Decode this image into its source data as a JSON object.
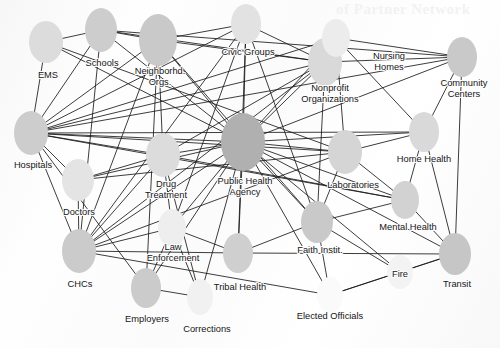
{
  "figure": {
    "type": "network-diagram",
    "domain_label": "public-health-partner-network",
    "background_color": "#fdfdfd",
    "node_fill_default": "#cfcfcf",
    "node_fill_central": "#b0b0b0",
    "edge_color": "#1a1a1a",
    "label_color": "#151515",
    "bleed_through_text": "of Partner Network"
  },
  "nodes": [
    {
      "id": "ems",
      "label": "EMS",
      "lines": [
        "EMS"
      ],
      "cx": 46,
      "cy": 42,
      "rx": 17,
      "ry": 21,
      "fill": "#dcdcdc",
      "label_x": 48,
      "label_y": 76,
      "interactable": true
    },
    {
      "id": "schools",
      "label": "Schools",
      "lines": [
        "Schools"
      ],
      "cx": 101,
      "cy": 30,
      "rx": 16,
      "ry": 22,
      "fill": "#cdcdcd",
      "label_x": 102,
      "label_y": 64,
      "interactable": true
    },
    {
      "id": "neighborhood",
      "label": "Neighborhd. Orgs.",
      "lines": [
        "Neighborhd.",
        "Orgs."
      ],
      "cx": 158,
      "cy": 40,
      "rx": 19,
      "ry": 26,
      "fill": "#c9c9c9",
      "label_x": 160,
      "label_y": 77,
      "interactable": true
    },
    {
      "id": "civic",
      "label": "Civic Groups",
      "lines": [
        "Civic Groups"
      ],
      "cx": 246,
      "cy": 24,
      "rx": 15,
      "ry": 20,
      "fill": "#e2e2e2",
      "label_x": 248,
      "label_y": 53,
      "interactable": true
    },
    {
      "id": "nonprofit",
      "label": "Nonprofit Organizations",
      "lines": [
        "Nonprofit",
        "Organizations"
      ],
      "cx": 325,
      "cy": 62,
      "rx": 17,
      "ry": 24,
      "fill": "#d9d9d9",
      "label_x": 330,
      "label_y": 94,
      "interactable": true
    },
    {
      "id": "nursing",
      "label": "Nursing Homes",
      "lines": [
        "Nursing",
        "Homes"
      ],
      "cx": 336,
      "cy": 38,
      "rx": 14,
      "ry": 19,
      "fill": "#ececec",
      "label_x": 389,
      "label_y": 62,
      "interactable": true
    },
    {
      "id": "community",
      "label": "Community Centers",
      "lines": [
        "Community",
        "Centers"
      ],
      "cx": 462,
      "cy": 57,
      "rx": 15,
      "ry": 20,
      "fill": "#c9c9c9",
      "label_x": 464,
      "label_y": 89,
      "interactable": true
    },
    {
      "id": "hospitals",
      "label": "Hospitals",
      "lines": [
        "Hospitals"
      ],
      "cx": 31,
      "cy": 133,
      "rx": 17,
      "ry": 22,
      "fill": "#cdcdcd",
      "label_x": 33,
      "label_y": 166,
      "interactable": true
    },
    {
      "id": "doctors",
      "label": "Doctors",
      "lines": [
        "Doctors"
      ],
      "cx": 78,
      "cy": 180,
      "rx": 16,
      "ry": 21,
      "fill": "#e4e4e4",
      "label_x": 79,
      "label_y": 213,
      "interactable": true
    },
    {
      "id": "drug",
      "label": "Drug Treatment",
      "lines": [
        "Drug",
        "Treatment"
      ],
      "cx": 163,
      "cy": 155,
      "rx": 17,
      "ry": 22,
      "fill": "#dcdcdc",
      "label_x": 166,
      "label_y": 190,
      "interactable": true
    },
    {
      "id": "publichealth",
      "label": "Public Health Agency",
      "lines": [
        "Public Health",
        "Agency"
      ],
      "cx": 243,
      "cy": 142,
      "rx": 22,
      "ry": 29,
      "fill": "#b0b0b0",
      "label_x": 245,
      "label_y": 187,
      "interactable": true
    },
    {
      "id": "laboratories",
      "label": "Laboratories",
      "lines": [
        "Laboratories"
      ],
      "cx": 345,
      "cy": 152,
      "rx": 17,
      "ry": 22,
      "fill": "#d5d5d5",
      "label_x": 353,
      "label_y": 186,
      "interactable": true
    },
    {
      "id": "homehealth",
      "label": "Home Health",
      "lines": [
        "Home Health"
      ],
      "cx": 424,
      "cy": 132,
      "rx": 15,
      "ry": 20,
      "fill": "#d9d9d9",
      "label_x": 424,
      "label_y": 160,
      "interactable": true
    },
    {
      "id": "mentalhealth",
      "label": "Mental Health",
      "lines": [
        "Mental Health"
      ],
      "cx": 405,
      "cy": 200,
      "rx": 14,
      "ry": 19,
      "fill": "#d2d2d2",
      "label_x": 408,
      "label_y": 228,
      "interactable": true
    },
    {
      "id": "chcs",
      "label": "CHCs",
      "lines": [
        "CHCs"
      ],
      "cx": 79,
      "cy": 251,
      "rx": 17,
      "ry": 22,
      "fill": "#cbcbcb",
      "label_x": 80,
      "label_y": 285,
      "interactable": true
    },
    {
      "id": "law",
      "label": "Law Enforcement",
      "lines": [
        "Law",
        "Enforcement"
      ],
      "cx": 172,
      "cy": 228,
      "rx": 14,
      "ry": 19,
      "fill": "#eeeeee",
      "label_x": 173,
      "label_y": 253,
      "interactable": true
    },
    {
      "id": "faith",
      "label": "Faith Instit.",
      "lines": [
        "Faith Instit."
      ],
      "cx": 317,
      "cy": 222,
      "rx": 16,
      "ry": 21,
      "fill": "#c9c9c9",
      "label_x": 320,
      "label_y": 251,
      "interactable": true
    },
    {
      "id": "transit",
      "label": "Transit",
      "lines": [
        "Transit"
      ],
      "cx": 455,
      "cy": 254,
      "rx": 16,
      "ry": 21,
      "fill": "#c6c6c6",
      "label_x": 457,
      "label_y": 285,
      "interactable": true
    },
    {
      "id": "fire",
      "label": "Fire",
      "lines": [
        "Fire"
      ],
      "cx": 400,
      "cy": 272,
      "rx": 13,
      "ry": 17,
      "fill": "#f3f3f3",
      "label_x": 400,
      "label_y": 275,
      "interactable": true
    },
    {
      "id": "tribal",
      "label": "Tribal Health",
      "lines": [
        "Tribal Health"
      ],
      "cx": 238,
      "cy": 253,
      "rx": 15,
      "ry": 20,
      "fill": "#cfcfcf",
      "label_x": 240,
      "label_y": 288,
      "interactable": true
    },
    {
      "id": "employers",
      "label": "Employers",
      "lines": [
        "Employers"
      ],
      "cx": 146,
      "cy": 288,
      "rx": 15,
      "ry": 20,
      "fill": "#cbcbcb",
      "label_x": 147,
      "label_y": 320,
      "interactable": true
    },
    {
      "id": "corrections",
      "label": "Corrections",
      "lines": [
        "Corrections"
      ],
      "cx": 200,
      "cy": 297,
      "rx": 13,
      "ry": 18,
      "fill": "#f1f1f1",
      "label_x": 207,
      "label_y": 330,
      "interactable": true
    },
    {
      "id": "elected",
      "label": "Elected Officials",
      "lines": [
        "Elected Officials"
      ],
      "cx": 330,
      "cy": 295,
      "rx": 13,
      "ry": 18,
      "fill": "#fafafa",
      "label_x": 330,
      "label_y": 317,
      "interactable": true
    }
  ],
  "edges": [
    {
      "source": "ems",
      "target": "hospitals"
    },
    {
      "source": "ems",
      "target": "publichealth"
    },
    {
      "source": "ems",
      "target": "schools"
    },
    {
      "source": "ems",
      "target": "laboratories"
    },
    {
      "source": "schools",
      "target": "neighborhood"
    },
    {
      "source": "schools",
      "target": "publichealth"
    },
    {
      "source": "schools",
      "target": "hospitals"
    },
    {
      "source": "schools",
      "target": "chcs"
    },
    {
      "source": "schools",
      "target": "community"
    },
    {
      "source": "schools",
      "target": "nonprofit"
    },
    {
      "source": "neighborhood",
      "target": "publichealth"
    },
    {
      "source": "neighborhood",
      "target": "hospitals"
    },
    {
      "source": "neighborhood",
      "target": "civic"
    },
    {
      "source": "neighborhood",
      "target": "chcs"
    },
    {
      "source": "neighborhood",
      "target": "drug"
    },
    {
      "source": "neighborhood",
      "target": "nonprofit"
    },
    {
      "source": "neighborhood",
      "target": "employers"
    },
    {
      "source": "neighborhood",
      "target": "faith"
    },
    {
      "source": "civic",
      "target": "publichealth"
    },
    {
      "source": "civic",
      "target": "nonprofit"
    },
    {
      "source": "civic",
      "target": "hospitals"
    },
    {
      "source": "civic",
      "target": "chcs"
    },
    {
      "source": "civic",
      "target": "tribal"
    },
    {
      "source": "civic",
      "target": "law"
    },
    {
      "source": "civic",
      "target": "faith"
    },
    {
      "source": "nonprofit",
      "target": "publichealth"
    },
    {
      "source": "nonprofit",
      "target": "hospitals"
    },
    {
      "source": "nonprofit",
      "target": "nursing"
    },
    {
      "source": "nonprofit",
      "target": "chcs"
    },
    {
      "source": "nonprofit",
      "target": "community"
    },
    {
      "source": "nonprofit",
      "target": "faith"
    },
    {
      "source": "nonprofit",
      "target": "drug"
    },
    {
      "source": "nursing",
      "target": "publichealth"
    },
    {
      "source": "nursing",
      "target": "community"
    },
    {
      "source": "nursing",
      "target": "homehealth"
    },
    {
      "source": "nursing",
      "target": "laboratories"
    },
    {
      "source": "nursing",
      "target": "hospitals"
    },
    {
      "source": "community",
      "target": "publichealth"
    },
    {
      "source": "community",
      "target": "homehealth"
    },
    {
      "source": "community",
      "target": "transit"
    },
    {
      "source": "community",
      "target": "hospitals"
    },
    {
      "source": "hospitals",
      "target": "publichealth"
    },
    {
      "source": "hospitals",
      "target": "doctors"
    },
    {
      "source": "hospitals",
      "target": "chcs"
    },
    {
      "source": "hospitals",
      "target": "laboratories"
    },
    {
      "source": "hospitals",
      "target": "drug"
    },
    {
      "source": "hospitals",
      "target": "homehealth"
    },
    {
      "source": "hospitals",
      "target": "mentalhealth"
    },
    {
      "source": "hospitals",
      "target": "employers"
    },
    {
      "source": "doctors",
      "target": "publichealth"
    },
    {
      "source": "doctors",
      "target": "chcs"
    },
    {
      "source": "doctors",
      "target": "laboratories"
    },
    {
      "source": "doctors",
      "target": "drug"
    },
    {
      "source": "drug",
      "target": "publichealth"
    },
    {
      "source": "drug",
      "target": "chcs"
    },
    {
      "source": "drug",
      "target": "mentalhealth"
    },
    {
      "source": "drug",
      "target": "law"
    },
    {
      "source": "drug",
      "target": "corrections"
    },
    {
      "source": "publichealth",
      "target": "laboratories"
    },
    {
      "source": "publichealth",
      "target": "chcs"
    },
    {
      "source": "publichealth",
      "target": "law"
    },
    {
      "source": "publichealth",
      "target": "faith"
    },
    {
      "source": "publichealth",
      "target": "tribal"
    },
    {
      "source": "publichealth",
      "target": "employers"
    },
    {
      "source": "publichealth",
      "target": "mentalhealth"
    },
    {
      "source": "publichealth",
      "target": "homehealth"
    },
    {
      "source": "publichealth",
      "target": "transit"
    },
    {
      "source": "publichealth",
      "target": "fire"
    },
    {
      "source": "publichealth",
      "target": "corrections"
    },
    {
      "source": "publichealth",
      "target": "elected"
    },
    {
      "source": "laboratories",
      "target": "chcs"
    },
    {
      "source": "laboratories",
      "target": "mentalhealth"
    },
    {
      "source": "laboratories",
      "target": "faith"
    },
    {
      "source": "laboratories",
      "target": "homehealth"
    },
    {
      "source": "homehealth",
      "target": "mentalhealth"
    },
    {
      "source": "homehealth",
      "target": "transit"
    },
    {
      "source": "mentalhealth",
      "target": "transit"
    },
    {
      "source": "mentalhealth",
      "target": "faith"
    },
    {
      "source": "chcs",
      "target": "law"
    },
    {
      "source": "chcs",
      "target": "tribal"
    },
    {
      "source": "law",
      "target": "employers"
    },
    {
      "source": "law",
      "target": "tribal"
    },
    {
      "source": "law",
      "target": "corrections"
    },
    {
      "source": "faith",
      "target": "tribal"
    },
    {
      "source": "faith",
      "target": "fire"
    },
    {
      "source": "faith",
      "target": "elected"
    },
    {
      "source": "fire",
      "target": "transit"
    },
    {
      "source": "fire",
      "target": "elected"
    },
    {
      "source": "tribal",
      "target": "transit"
    },
    {
      "source": "employers",
      "target": "corrections"
    },
    {
      "source": "elected",
      "target": "transit"
    },
    {
      "source": "elected",
      "target": "chcs"
    }
  ]
}
